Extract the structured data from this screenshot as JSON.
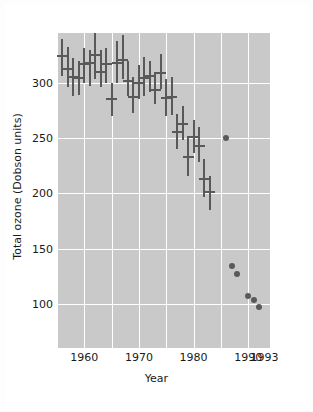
{
  "chart_data": {
    "type": "scatter",
    "title": "",
    "xlabel": "Year",
    "ylabel": "Total ozone (Dobson units)",
    "xlim": [
      1955,
      1994
    ],
    "ylim": [
      60,
      345
    ],
    "grid": true,
    "legend": null,
    "y_ticks": [
      100,
      150,
      200,
      250,
      300
    ],
    "x_ticks": [
      1960,
      1970,
      1980,
      1990,
      1993
    ],
    "y_tick_labels": [
      "100",
      "150",
      "200",
      "250",
      "300"
    ],
    "x_tick_labels": [
      "1960",
      "1970",
      "1980",
      "1990",
      "1993"
    ],
    "series": [
      {
        "name": "October mean total ozone with range",
        "marker": "errorbar",
        "color": "#595959",
        "points": [
          {
            "x": 1956,
            "y": 324,
            "low": 306,
            "high": 340
          },
          {
            "x": 1957,
            "y": 312,
            "low": 296,
            "high": 332
          },
          {
            "x": 1958,
            "y": 305,
            "low": 288,
            "high": 322
          },
          {
            "x": 1959,
            "y": 304,
            "low": 289,
            "high": 320
          },
          {
            "x": 1960,
            "y": 317,
            "low": 300,
            "high": 331
          },
          {
            "x": 1961,
            "y": 318,
            "low": 297,
            "high": 330
          },
          {
            "x": 1962,
            "y": 325,
            "low": 303,
            "high": 345
          },
          {
            "x": 1963,
            "y": 310,
            "low": 296,
            "high": 330
          },
          {
            "x": 1964,
            "y": 317,
            "low": 300,
            "high": 331
          },
          {
            "x": 1965,
            "y": 285,
            "low": 270,
            "high": 300
          },
          {
            "x": 1966,
            "y": 318,
            "low": 300,
            "high": 338
          },
          {
            "x": 1967,
            "y": 321,
            "low": 303,
            "high": 343
          },
          {
            "x": 1968,
            "y": 302,
            "low": 288,
            "high": 320
          },
          {
            "x": 1969,
            "y": 287,
            "low": 273,
            "high": 305
          },
          {
            "x": 1970,
            "y": 300,
            "low": 285,
            "high": 316
          },
          {
            "x": 1971,
            "y": 304,
            "low": 288,
            "high": 323
          },
          {
            "x": 1972,
            "y": 306,
            "low": 292,
            "high": 320
          },
          {
            "x": 1973,
            "y": 293,
            "low": 281,
            "high": 310
          },
          {
            "x": 1974,
            "y": 309,
            "low": 294,
            "high": 326
          },
          {
            "x": 1975,
            "y": 286,
            "low": 270,
            "high": 303
          },
          {
            "x": 1976,
            "y": 287,
            "low": 271,
            "high": 305
          },
          {
            "x": 1977,
            "y": 255,
            "low": 240,
            "high": 272
          },
          {
            "x": 1978,
            "y": 263,
            "low": 248,
            "high": 279
          },
          {
            "x": 1979,
            "y": 233,
            "low": 216,
            "high": 252
          },
          {
            "x": 1980,
            "y": 251,
            "low": 236,
            "high": 266
          },
          {
            "x": 1981,
            "y": 243,
            "low": 228,
            "high": 260
          },
          {
            "x": 1982,
            "y": 213,
            "low": 197,
            "high": 231
          },
          {
            "x": 1983,
            "y": 201,
            "low": 185,
            "high": 216
          }
        ]
      },
      {
        "name": "Later single observations",
        "marker": "dot",
        "color": "#5a5a5a",
        "points": [
          {
            "x": 1986,
            "y": 250
          },
          {
            "x": 1987,
            "y": 134
          },
          {
            "x": 1988,
            "y": 127
          },
          {
            "x": 1990,
            "y": 107
          },
          {
            "x": 1991,
            "y": 103
          },
          {
            "x": 1992,
            "y": 97
          }
        ]
      }
    ]
  },
  "figure": {
    "background_color": "#ffffff",
    "plot_background_color": "#c9c9c9",
    "grid_color": "#ffffff",
    "marker_color": "#595959"
  }
}
